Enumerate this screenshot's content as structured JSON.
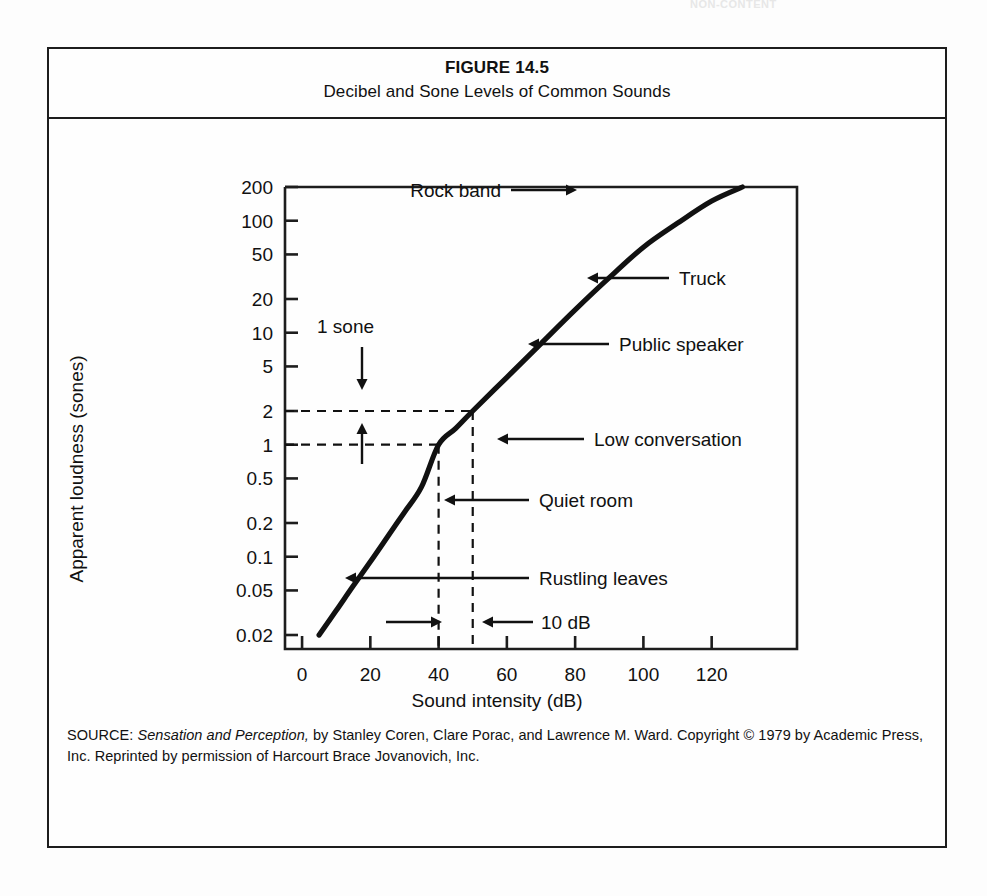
{
  "page": {
    "running_head": "NON-CONTENT"
  },
  "figure": {
    "number": "FIGURE 14.5",
    "title": "Decibel and Sone Levels of Common Sounds",
    "source_prefix": "SOURCE:",
    "source_italic": "Sensation and Perception,",
    "source_rest": " by Stanley Coren, Clare Porac, and Lawrence M. Ward. Copyright © 1979 by Academic Press, Inc. Reprinted by permission of Harcourt Brace Jovanovich, Inc."
  },
  "chart_data": {
    "type": "line",
    "title": "Decibel and Sone Levels of Common Sounds",
    "xlabel": "Sound intensity (dB)",
    "ylabel": "Apparent loudness (sones)",
    "xlim": [
      -5,
      145
    ],
    "ylim": [
      0.015,
      200
    ],
    "yscale": "log",
    "grid": false,
    "legend": "none",
    "xticks": [
      0,
      20,
      40,
      60,
      80,
      100,
      120
    ],
    "xtick_labels": [
      "0",
      "20",
      "40",
      "60",
      "80",
      "100",
      "120"
    ],
    "yticks": [
      200,
      100,
      50,
      20,
      10,
      5,
      2,
      1,
      0.5,
      0.2,
      0.1,
      0.05,
      0.02
    ],
    "ytick_labels": [
      "200",
      "100",
      "50",
      "20",
      "10",
      "5",
      "2",
      "1",
      "0.5",
      "0.2",
      "0.1",
      "0.05",
      "0.02"
    ],
    "series": [
      {
        "name": "Loudness function",
        "x": [
          5,
          10,
          15,
          20,
          25,
          30,
          35,
          40,
          45,
          50,
          60,
          70,
          80,
          90,
          100,
          110,
          120,
          129
        ],
        "y": [
          0.02,
          0.033,
          0.055,
          0.09,
          0.15,
          0.25,
          0.42,
          1.0,
          1.4,
          2.0,
          4.0,
          8.0,
          16.0,
          31.0,
          58.0,
          95.0,
          150.0,
          200.0
        ]
      }
    ],
    "reference_lines": [
      {
        "name": "2-sone horizontal",
        "orientation": "horizontal",
        "value": 2,
        "style": "dashed"
      },
      {
        "name": "1-sone horizontal",
        "orientation": "horizontal",
        "value": 1,
        "style": "dashed"
      },
      {
        "name": "40-dB vertical",
        "orientation": "vertical",
        "value": 40,
        "style": "dashed"
      },
      {
        "name": "50-dB vertical",
        "orientation": "vertical",
        "value": 50,
        "style": "dashed"
      }
    ],
    "annotations": [
      {
        "label": "Rock band",
        "x": 110,
        "y": 160,
        "arrow": "right"
      },
      {
        "label": "Truck",
        "x": 90,
        "y": 40,
        "arrow": "left"
      },
      {
        "label": "Public speaker",
        "x": 75,
        "y": 10,
        "arrow": "left"
      },
      {
        "label": "Low conversation",
        "x": 50,
        "y": 2,
        "arrow": "left"
      },
      {
        "label": "Quiet room",
        "x": 40,
        "y": 0.8,
        "arrow": "left"
      },
      {
        "label": "Rustling leaves",
        "x": 25,
        "y": 0.17,
        "arrow": "left"
      },
      {
        "label": "10 dB",
        "x": 45,
        "y": 0.075,
        "arrow": "double-horizontal"
      },
      {
        "label": "1 sone",
        "x": 22,
        "y": 1.4,
        "arrow": "double-vertical"
      }
    ]
  },
  "colors": {
    "ink": "#111111",
    "frame": "#1d1d1d",
    "background": "#fefefe"
  }
}
